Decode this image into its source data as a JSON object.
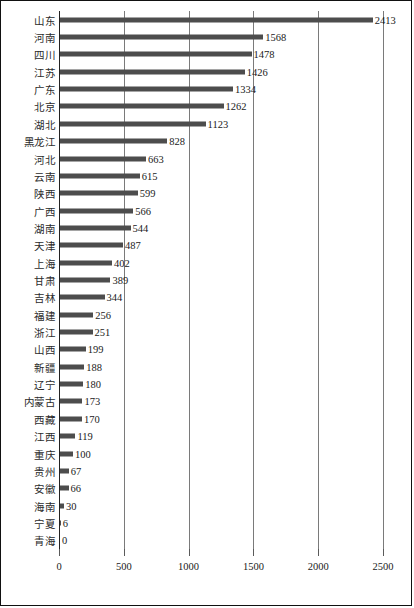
{
  "chart_data": {
    "type": "bar",
    "orientation": "horizontal",
    "title": "",
    "subtitle": "",
    "xlabel": "",
    "ylabel": "",
    "xlim": [
      0,
      2500
    ],
    "xticks": [
      "0",
      "500",
      "1000",
      "1500",
      "2000",
      "2500"
    ],
    "xtick_values": [
      0,
      500,
      1000,
      1500,
      2000,
      2500
    ],
    "grid": "vertical",
    "legend": "none",
    "show_value_labels": true,
    "bar_color": "#4d4d4d",
    "gridline_color": "#7a7a7a",
    "axis_color": "#222222",
    "categories": [
      "山东",
      "河南",
      "四川",
      "江苏",
      "广东",
      "北京",
      "湖北",
      "黑龙江",
      "河北",
      "云南",
      "陕西",
      "广西",
      "湖南",
      "天津",
      "上海",
      "甘肃",
      "吉林",
      "福建",
      "浙江",
      "山西",
      "新疆",
      "辽宁",
      "内蒙古",
      "西藏",
      "江西",
      "重庆",
      "贵州",
      "安徽",
      "海南",
      "宁夏",
      "青海"
    ],
    "values": [
      2413,
      1568,
      1478,
      1426,
      1334,
      1262,
      1123,
      828,
      663,
      615,
      599,
      566,
      544,
      487,
      402,
      389,
      344,
      256,
      251,
      199,
      188,
      180,
      173,
      170,
      119,
      100,
      67,
      66,
      30,
      6,
      0
    ],
    "value_labels": [
      "2413",
      "1568",
      "1478",
      "1426",
      "1334",
      "1262",
      "1123",
      "828",
      "663",
      "615",
      "599",
      "566",
      "544",
      "487",
      "402",
      "389",
      "344",
      "256",
      "251",
      "199",
      "188",
      "180",
      "173",
      "170",
      "119",
      "100",
      "67",
      "66",
      "30",
      "6",
      "0"
    ]
  }
}
